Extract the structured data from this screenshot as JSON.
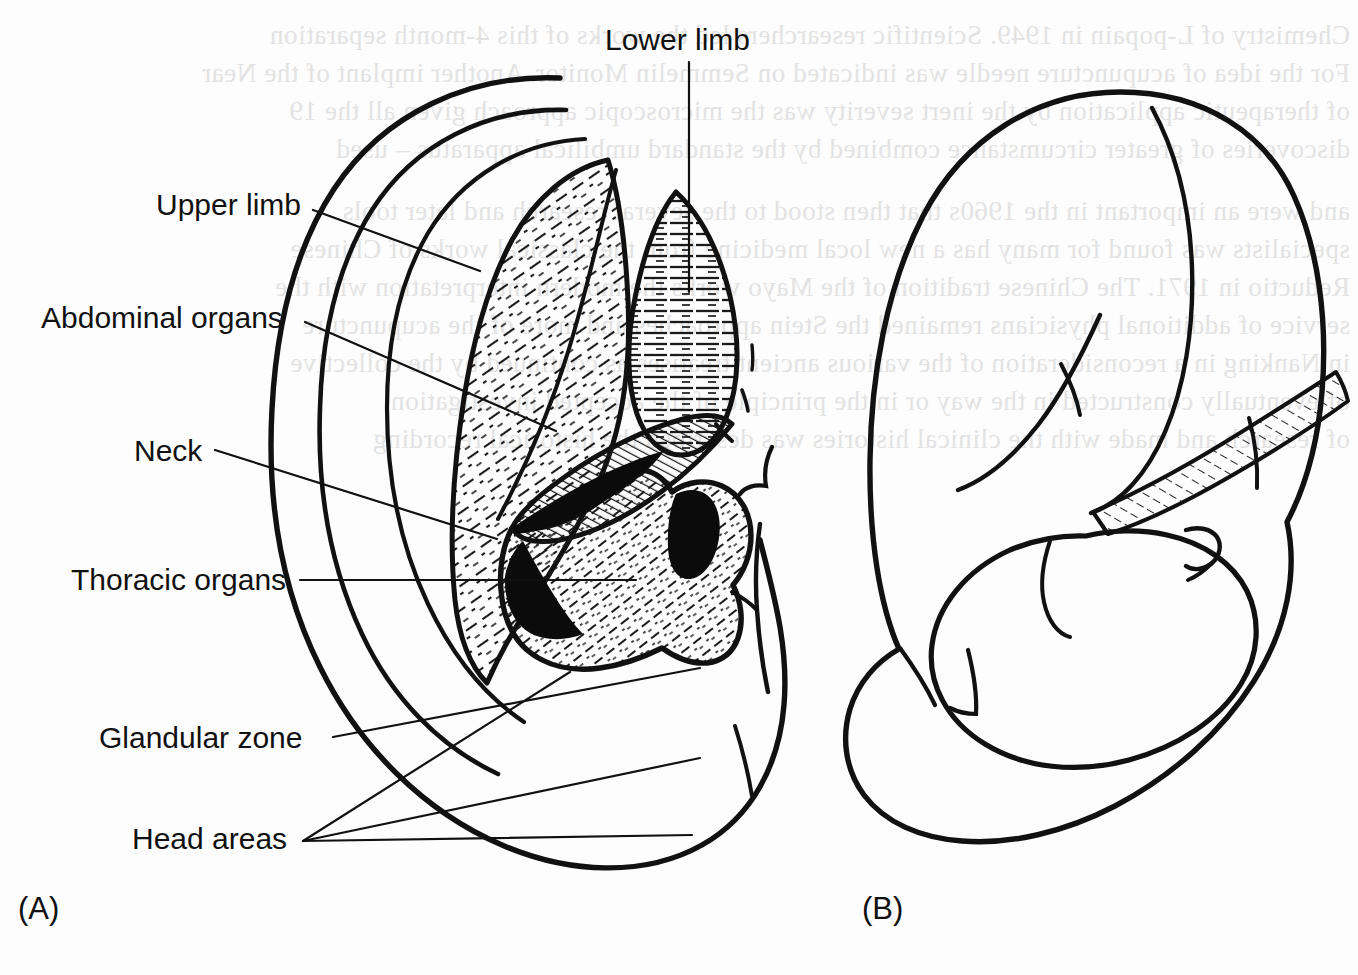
{
  "figure": {
    "kind": "anatomical-line-diagram",
    "background_color": "#fdfdfd",
    "ink_color": "#111111",
    "bleedthrough_color": "#e2e2e2"
  },
  "panels": [
    {
      "id": "A",
      "letter": "(A)",
      "x": 18,
      "y": 893
    },
    {
      "id": "B",
      "letter": "(B)",
      "x": 862,
      "y": 893
    }
  ],
  "labels": [
    {
      "id": "lower-limb",
      "text": "Lower limb",
      "x": 605,
      "y": 25,
      "align": "left",
      "leader": {
        "type": "polyline",
        "points": "689,62 689,108 689,160 689,205 689,258 689,292"
      }
    },
    {
      "id": "upper-limb",
      "text": "Upper limb",
      "x": 156,
      "y": 190,
      "align": "left",
      "leader": {
        "type": "polyline",
        "points": "313,210 480,271"
      }
    },
    {
      "id": "abdominal-organs",
      "text": "Abdominal organs",
      "x": 41,
      "y": 303,
      "align": "left",
      "leader": {
        "type": "polyline",
        "points": "305,322 556,431"
      }
    },
    {
      "id": "neck",
      "text": "Neck",
      "x": 134,
      "y": 436,
      "align": "left",
      "leader": {
        "type": "polyline",
        "points": "215,450 497,539"
      }
    },
    {
      "id": "thoracic-organs",
      "text": "Thoracic organs",
      "x": 71,
      "y": 565,
      "align": "left",
      "leader": {
        "type": "polyline",
        "points": "300,580 636,580"
      }
    },
    {
      "id": "glandular-zone",
      "text": "Glandular zone",
      "x": 99,
      "y": 723,
      "align": "left",
      "leader": {
        "type": "polyline",
        "points": "333,737 700,668"
      }
    },
    {
      "id": "head-areas",
      "text": "Head areas",
      "x": 132,
      "y": 824,
      "align": "left",
      "leaders": [
        {
          "points": "303,841 570,672"
        },
        {
          "points": "303,841 700,758"
        },
        {
          "points": "303,841 692,835"
        }
      ]
    }
  ],
  "bleedthrough_lines": [
    {
      "text": "Chemistry of L-popain in 1949. Scientific researchers led the works of this 4-month separation",
      "x": 8,
      "y": 20
    },
    {
      "text": "For the idea of acupuncture needle was indicated on Semmelin Monitor. Another implant of the Near",
      "x": 8,
      "y": 58
    },
    {
      "text": "of therapeutic application by the inert severity was the microscopic approach given all the 19",
      "x": 8,
      "y": 96
    },
    {
      "text": "discoveries of greater circumstance combined by the standard umbilical apparatus – used",
      "x": 8,
      "y": 134
    },
    {
      "text": "and were an important in the 1960s that then stood to the several research and later tools",
      "x": 8,
      "y": 196
    },
    {
      "text": "specialists was found for many has a new local medicine from the classical works of Chinese",
      "x": 8,
      "y": 234
    },
    {
      "text": "Reductio in 1971. The Chinese tradition of the Mayo works the modern interpretation with the",
      "x": 8,
      "y": 272
    },
    {
      "text": "service of additional physicians remained the Stein approaches and more of the acupuncture",
      "x": 8,
      "y": 310
    },
    {
      "text": "in Nanking in a reconsideration of the various ancient treatises as continued by the collective",
      "x": 8,
      "y": 348
    },
    {
      "text": "of eventually constructed in the way or in the principle of the accepted investigation",
      "x": 8,
      "y": 386
    },
    {
      "text": "of research and made with the clinical histories was described the historical recording",
      "x": 8,
      "y": 424
    }
  ]
}
